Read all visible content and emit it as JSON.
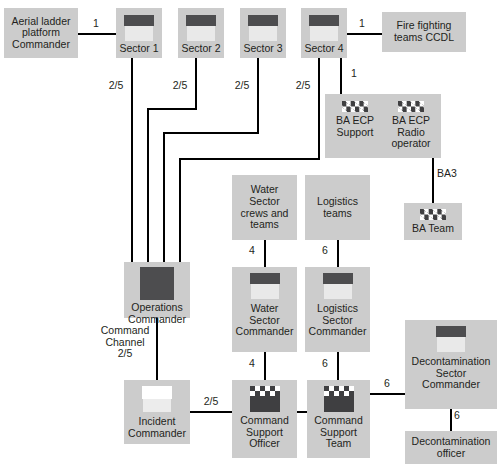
{
  "diagram": {
    "box_fill": "#cccccc",
    "line_color": "#000000",
    "text_color": "#231f20",
    "icon_dark": "#4d4d4f"
  },
  "nodes": {
    "aerial_ladder": {
      "label": "Aerial ladder\nplatform\nCommander",
      "icon": "none"
    },
    "sector1": {
      "label": "Sector 1",
      "icon": "helmet-icon"
    },
    "sector2": {
      "label": "Sector 2",
      "icon": "helmet-icon"
    },
    "sector3": {
      "label": "Sector 3",
      "icon": "helmet-icon"
    },
    "sector4": {
      "label": "Sector 4",
      "icon": "helmet-icon"
    },
    "fire_fighting": {
      "label": "Fire fighting\nteams CCDL",
      "icon": "none"
    },
    "ba_ecp_support": {
      "label": "BA ECP\nSupport",
      "icon": "checkered-badge-icon"
    },
    "ba_ecp_radio": {
      "label": "BA ECP\nRadio\noperator",
      "icon": "checkered-badge-icon"
    },
    "ba_team": {
      "label": "BA Team",
      "icon": "checkered-badge-icon"
    },
    "water_crews": {
      "label": "Water\nSector\ncrews and\nteams",
      "icon": "none"
    },
    "logistics_teams": {
      "label": "Logistics\nteams",
      "icon": "none"
    },
    "operations_commander": {
      "label": "Operations\nCommander",
      "icon": "solid-square-icon"
    },
    "water_sector_commander": {
      "label": "Water\nSector\nCommander",
      "icon": "helmet-icon"
    },
    "logistics_sector_commander": {
      "label": "Logistics\nSector\nCommander",
      "icon": "helmet-icon"
    },
    "decon_sector_commander": {
      "label": "Decontamination\nSector\nCommander",
      "icon": "helmet-icon"
    },
    "incident_commander": {
      "label": "Incident\nCommander",
      "icon": "white-helmet-icon"
    },
    "command_support_officer": {
      "label": "Command\nSupport\nOfficer",
      "icon": "checkered-cap-icon"
    },
    "command_support_team": {
      "label": "Command\nSupport\nTeam",
      "icon": "checkered-cap-icon"
    },
    "decon_officer": {
      "label": "Decontamination\nofficer",
      "icon": "none"
    }
  },
  "edge_labels": {
    "aerial_to_sector1": "1",
    "sector1_channel": "2/5",
    "sector2_channel": "2/5",
    "sector3_channel": "2/5",
    "sector4_channel": "2/5",
    "sector4_to_fire": "1",
    "sector4_to_baecp": "1",
    "baecp_to_bateam": "BA3",
    "water_crews_to_cmdr": "4",
    "logistics_teams_to_cmdr": "6",
    "ops_to_incident": "Command\nChannel\n2/5",
    "water_cmdr_to_cso": "4",
    "logistics_cmdr_to_cst": "6",
    "incident_to_cso": "2/5",
    "cst_to_decon": "6",
    "decon_to_officer": "6"
  }
}
